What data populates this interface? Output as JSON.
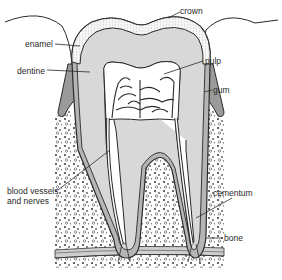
{
  "diagram": {
    "labels": {
      "crown": "crown",
      "enamel": "enamel",
      "dentine": "dentine",
      "pulp": "pulp",
      "gum": "gum",
      "blood_vessels_line1": "blood vessels",
      "blood_vessels_line2": "and nerves",
      "cementum": "cementum",
      "bone": "bone"
    },
    "colors": {
      "outline": "#2a2a2a",
      "enamel": "#f4f4f4",
      "dentine": "#d8d8d8",
      "pulp": "#ffffff",
      "gum": "#9a9a9a",
      "cementum": "#b5b5b5",
      "bone_bg": "#ffffff",
      "bone_speckle": "#555555"
    }
  }
}
